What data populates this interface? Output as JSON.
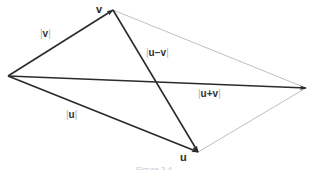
{
  "diagram": {
    "type": "vector-parallelogram",
    "points": {
      "origin": {
        "x": 8,
        "y": 76
      },
      "v": {
        "x": 113,
        "y": 10
      },
      "u": {
        "x": 198,
        "y": 152
      },
      "u_plus_v": {
        "x": 306,
        "y": 88
      }
    },
    "point_labels": {
      "v": "v",
      "u": "u"
    },
    "magnitude_labels": {
      "v": {
        "bar_left": "|",
        "text": "v",
        "bar_right": "|"
      },
      "u": {
        "bar_left": "|",
        "text": "u",
        "bar_right": "|"
      },
      "u_minus_v": {
        "bar_left": "|",
        "text": "u−v",
        "bar_right": "|"
      },
      "u_plus_v": {
        "bar_left": "|",
        "text": "u+v",
        "bar_right": "|"
      }
    },
    "colors": {
      "vector": "#2b2b2b",
      "parallelogram_side": "#b8b8b8",
      "bar": "#b0b0b0"
    },
    "caption": "Figure 3.4"
  }
}
